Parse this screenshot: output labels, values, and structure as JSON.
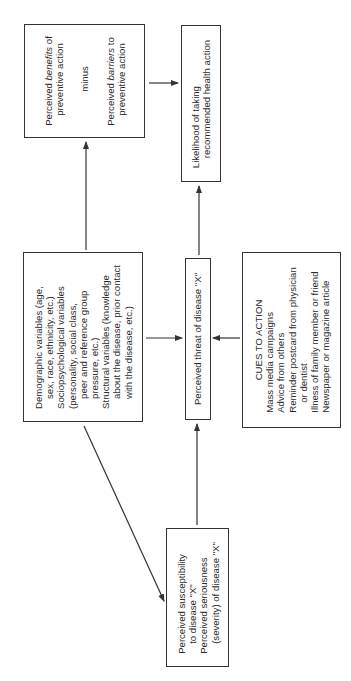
{
  "diagram": {
    "orientation": "rotated 90 degrees counterclockwise",
    "boxes": {
      "benefits_barriers": {
        "line1_prefix": "Perceived ",
        "line1_em": "benefits",
        "line1_suffix": " of",
        "line2": "preventive action",
        "middle": "minus",
        "line3_prefix": "Perceived ",
        "line3_em": "barriers",
        "line3_suffix": " to",
        "line4": "preventive action"
      },
      "likelihood": {
        "line1": "Likelihood of taking",
        "line2": "recommended health action"
      },
      "modifying_factors": {
        "lines": [
          "Demographic variables (age,",
          "sex, race, ethnicity, etc.)",
          "Sociopsychological variables",
          "(personality, social class,",
          "peer and reference group",
          "pressure, etc.)",
          "Structural variables (knowledge",
          "about the disease, prior contact",
          "with the disease, etc.)"
        ]
      },
      "threat": {
        "label": "Perceived threat of disease \"X\""
      },
      "cues_to_action": {
        "heading": "CUES TO ACTION",
        "lines": [
          "Mass media campaigns",
          "Advice from others",
          "Reminder postcard from physician",
          "or dentist",
          "Illness of family member or friend",
          "Newspaper or magazine article"
        ]
      },
      "susceptibility_seriousness": {
        "lines": [
          "Perceived susceptibility",
          "to disease \"X\"",
          "Perceived seriousness",
          "(severity) of disease \"X\""
        ]
      }
    },
    "edges": [
      {
        "from": "modifying_factors",
        "to": "benefits_barriers"
      },
      {
        "from": "modifying_factors",
        "to": "threat"
      },
      {
        "from": "modifying_factors",
        "to": "susceptibility_seriousness"
      },
      {
        "from": "susceptibility_seriousness",
        "to": "threat"
      },
      {
        "from": "cues_to_action",
        "to": "threat"
      },
      {
        "from": "threat",
        "to": "likelihood"
      },
      {
        "from": "benefits_barriers",
        "to": "likelihood"
      }
    ],
    "colors": {
      "line": "#333333",
      "text": "#2a2a2a",
      "background": "#ffffff"
    }
  }
}
